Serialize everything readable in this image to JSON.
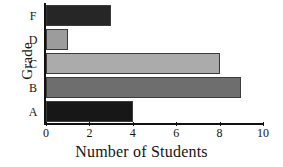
{
  "chart_data": {
    "type": "bar",
    "orientation": "horizontal",
    "title": "",
    "xlabel": "Number of Students",
    "ylabel": "Grade",
    "categories": [
      "F",
      "D",
      "C",
      "B",
      "A"
    ],
    "values": [
      3,
      1,
      8,
      9,
      4
    ],
    "bar_colors": [
      "#262626",
      "#9c9c9c",
      "#ababab",
      "#6e6e6e",
      "#171717"
    ],
    "xlim": [
      0,
      10
    ],
    "xticks": [
      0,
      2,
      4,
      6,
      8,
      10
    ],
    "xticklabels": [
      "0",
      "2",
      "4",
      "6",
      "8",
      "10"
    ],
    "grid": false,
    "legend": false,
    "axis_color": "#111111",
    "background": "#ffffff",
    "bars": [
      {
        "category": "F",
        "value": 3,
        "color": "#262626"
      },
      {
        "category": "D",
        "value": 1,
        "color": "#9c9c9c"
      },
      {
        "category": "C",
        "value": 8,
        "color": "#ababab"
      },
      {
        "category": "B",
        "value": 9,
        "color": "#6e6e6e"
      },
      {
        "category": "A",
        "value": 4,
        "color": "#171717"
      }
    ]
  }
}
